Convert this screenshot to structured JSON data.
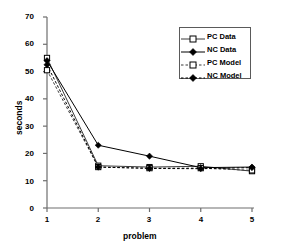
{
  "chart_data": {
    "type": "line",
    "title": "",
    "xlabel": "problem",
    "ylabel": "seconds",
    "x": [
      1,
      2,
      3,
      4,
      5
    ],
    "xlim": [
      1,
      5
    ],
    "ylim": [
      0,
      70
    ],
    "ytick_labels": [
      "0",
      "10",
      "20",
      "30",
      "40",
      "50",
      "60",
      "70"
    ],
    "yticks": [
      0,
      10,
      20,
      30,
      40,
      50,
      60,
      70
    ],
    "xtick_labels": [
      "1",
      "2",
      "3",
      "4",
      "5"
    ],
    "xticks": [
      1,
      2,
      3,
      4,
      5
    ],
    "grid": false,
    "legend_position": "upper right",
    "series": [
      {
        "name": "PC Data",
        "line_style": "solid",
        "marker": "open-square",
        "color": "#3b3b3b",
        "values": [
          55,
          15.5,
          15,
          15.3,
          13.5
        ]
      },
      {
        "name": "NC Data",
        "line_style": "solid",
        "marker": "filled-diamond",
        "color": "#000000",
        "values": [
          54,
          23,
          19,
          14.8,
          15
        ]
      },
      {
        "name": "PC Model",
        "line_style": "dashed",
        "marker": "open-square",
        "color": "#3b3b3b",
        "values": [
          50.5,
          15,
          14.6,
          14.6,
          13.8
        ]
      },
      {
        "name": "NC Model",
        "line_style": "dashed",
        "marker": "filled-diamond",
        "color": "#000000",
        "values": [
          52.5,
          15,
          14.5,
          14.4,
          14.8
        ]
      }
    ]
  },
  "axes": {
    "x_axis_label": "problem",
    "y_axis_label": "seconds"
  },
  "legend": {
    "entries": [
      {
        "label": "PC Data"
      },
      {
        "label": "NC Data"
      },
      {
        "label": "PC Model"
      },
      {
        "label": "NC Model"
      }
    ]
  }
}
